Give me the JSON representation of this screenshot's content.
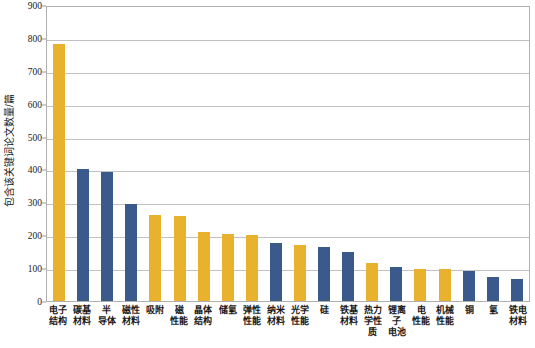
{
  "chart_data": {
    "type": "bar",
    "title": "",
    "xlabel": "",
    "ylabel": "包含该关键词论文数量/篇",
    "ylim": [
      0,
      900
    ],
    "ytick_step": 100,
    "grid": true,
    "legend": "none",
    "yticks": [
      "900",
      "800",
      "700",
      "600",
      "500",
      "400",
      "300",
      "200",
      "100",
      "0"
    ],
    "colors": {
      "yellow": "#E8B22E",
      "blue": "#3A5A8C",
      "gridline": "#c2c2c2",
      "border": "#b0b0b0",
      "text": "#1a1a1a"
    },
    "categories": [
      "电子结构",
      "碳基材料",
      "半导体",
      "磁性材料",
      "吸附",
      "磁性能",
      "晶体结构",
      "储氢",
      "弹性性能",
      "纳米材料",
      "光学性能",
      "硅",
      "铁基材料",
      "热力学性质",
      "锂离子电池",
      "电性能",
      "机械性能",
      "铜",
      "氢",
      "铁电材料"
    ],
    "bars": [
      {
        "label_line1": "电子",
        "label_line2": "结构",
        "value": 783,
        "color": "yellow"
      },
      {
        "label_line1": "碳基",
        "label_line2": "材料",
        "value": 400,
        "color": "blue"
      },
      {
        "label_line1": "半",
        "label_line2": "导体",
        "value": 391,
        "color": "blue"
      },
      {
        "label_line1": "磁性",
        "label_line2": "材料",
        "value": 295,
        "color": "blue"
      },
      {
        "label_line1": "吸附",
        "label_line2": "",
        "value": 263,
        "color": "yellow"
      },
      {
        "label_line1": "磁",
        "label_line2": "性能",
        "value": 258,
        "color": "yellow"
      },
      {
        "label_line1": "晶体",
        "label_line2": "结构",
        "value": 210,
        "color": "yellow"
      },
      {
        "label_line1": "储氢",
        "label_line2": "",
        "value": 205,
        "color": "yellow"
      },
      {
        "label_line1": "弹性",
        "label_line2": "性能",
        "value": 200,
        "color": "yellow"
      },
      {
        "label_line1": "纳米",
        "label_line2": "材料",
        "value": 175,
        "color": "blue"
      },
      {
        "label_line1": "光学",
        "label_line2": "性能",
        "value": 170,
        "color": "yellow"
      },
      {
        "label_line1": "硅",
        "label_line2": "",
        "value": 165,
        "color": "blue"
      },
      {
        "label_line1": "铁基",
        "label_line2": "材料",
        "value": 150,
        "color": "blue"
      },
      {
        "label_line1": "热力",
        "label_line2": "学性质",
        "value": 115,
        "color": "yellow"
      },
      {
        "label_line1": "锂离子",
        "label_line2": "电池",
        "value": 105,
        "color": "blue"
      },
      {
        "label_line1": "电",
        "label_line2": "性能",
        "value": 98,
        "color": "yellow"
      },
      {
        "label_line1": "机械",
        "label_line2": "性能",
        "value": 97,
        "color": "yellow"
      },
      {
        "label_line1": "铜",
        "label_line2": "",
        "value": 92,
        "color": "blue"
      },
      {
        "label_line1": "氢",
        "label_line2": "",
        "value": 72,
        "color": "blue"
      },
      {
        "label_line1": "铁电",
        "label_line2": "材料",
        "value": 67,
        "color": "blue"
      }
    ]
  }
}
